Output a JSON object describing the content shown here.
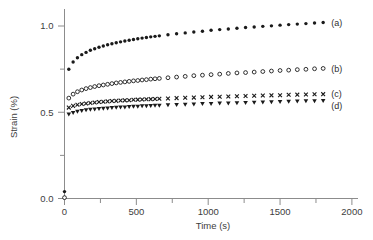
{
  "figure": {
    "background": "#ffffff",
    "ink_color": "#1a1a1a",
    "axis_color": "#8c8c8c",
    "text_color": "#3d3d3d"
  },
  "chart_data": {
    "type": "scatter",
    "title": "",
    "xlabel": "Time (s)",
    "ylabel": "Strain (%)",
    "xlim": [
      0,
      2000
    ],
    "ylim": [
      0,
      1.1
    ],
    "grid": false,
    "legend_position": "inline-right-of-last-point",
    "x_major_ticks": [
      0,
      500,
      1000,
      1500,
      2000
    ],
    "x_tick_labels": [
      "0",
      "500",
      "1000",
      "1500",
      "2000"
    ],
    "x_minor_ticks": [
      250,
      750,
      1250,
      1750
    ],
    "y_major_ticks": [
      0.0,
      0.5,
      1.0
    ],
    "y_tick_labels": [
      "0.0",
      "0.5",
      "1.0"
    ],
    "y_minor_ticks": [
      0.25,
      0.75
    ],
    "times": [
      30,
      60,
      90,
      120,
      150,
      180,
      210,
      240,
      270,
      300,
      330,
      360,
      390,
      420,
      450,
      480,
      510,
      540,
      570,
      600,
      630,
      660,
      720,
      780,
      840,
      900,
      960,
      1020,
      1080,
      1140,
      1200,
      1260,
      1320,
      1380,
      1440,
      1500,
      1560,
      1620,
      1680,
      1740,
      1800
    ],
    "series": [
      {
        "name": "a",
        "label": "(a)",
        "marker": "filled-circle",
        "color": "#1a1a1a",
        "origin_point": [
          0,
          0.04
        ],
        "values": [
          0.749,
          0.791,
          0.816,
          0.834,
          0.847,
          0.859,
          0.868,
          0.877,
          0.884,
          0.891,
          0.897,
          0.903,
          0.908,
          0.913,
          0.917,
          0.922,
          0.926,
          0.93,
          0.933,
          0.937,
          0.94,
          0.943,
          0.949,
          0.955,
          0.96,
          0.965,
          0.97,
          0.975,
          0.979,
          0.983,
          0.987,
          0.991,
          0.994,
          0.998,
          1.001,
          1.005,
          1.008,
          1.011,
          1.014,
          1.017,
          1.02
        ]
      },
      {
        "name": "b",
        "label": "(b)",
        "marker": "open-circle",
        "color": "#1a1a1a",
        "origin_point": [
          0,
          0.005
        ],
        "values": [
          0.582,
          0.605,
          0.619,
          0.629,
          0.637,
          0.643,
          0.649,
          0.654,
          0.658,
          0.662,
          0.666,
          0.67,
          0.673,
          0.676,
          0.679,
          0.682,
          0.684,
          0.687,
          0.689,
          0.692,
          0.694,
          0.696,
          0.7,
          0.704,
          0.708,
          0.712,
          0.715,
          0.718,
          0.721,
          0.725,
          0.728,
          0.73,
          0.733,
          0.736,
          0.739,
          0.742,
          0.744,
          0.747,
          0.749,
          0.752,
          0.754
        ]
      },
      {
        "name": "c",
        "label": "(c)",
        "marker": "x",
        "color": "#1a1a1a",
        "origin_point": null,
        "values": [
          0.527,
          0.537,
          0.543,
          0.548,
          0.551,
          0.554,
          0.557,
          0.559,
          0.561,
          0.563,
          0.565,
          0.566,
          0.568,
          0.569,
          0.57,
          0.572,
          0.573,
          0.574,
          0.575,
          0.576,
          0.577,
          0.578,
          0.58,
          0.582,
          0.584,
          0.585,
          0.587,
          0.589,
          0.59,
          0.591,
          0.593,
          0.594,
          0.596,
          0.597,
          0.598,
          0.599,
          0.601,
          0.602,
          0.603,
          0.604,
          0.605
        ]
      },
      {
        "name": "d",
        "label": "(d)",
        "marker": "filled-triangle-down",
        "color": "#1a1a1a",
        "origin_point": null,
        "values": [
          0.488,
          0.498,
          0.504,
          0.509,
          0.513,
          0.516,
          0.518,
          0.52,
          0.522,
          0.524,
          0.526,
          0.528,
          0.529,
          0.53,
          0.532,
          0.533,
          0.534,
          0.536,
          0.537,
          0.538,
          0.539,
          0.54,
          0.542,
          0.544,
          0.545,
          0.547,
          0.549,
          0.55,
          0.552,
          0.553,
          0.554,
          0.556,
          0.557,
          0.558,
          0.56,
          0.561,
          0.562,
          0.564,
          0.565,
          0.566,
          0.567
        ]
      }
    ]
  }
}
